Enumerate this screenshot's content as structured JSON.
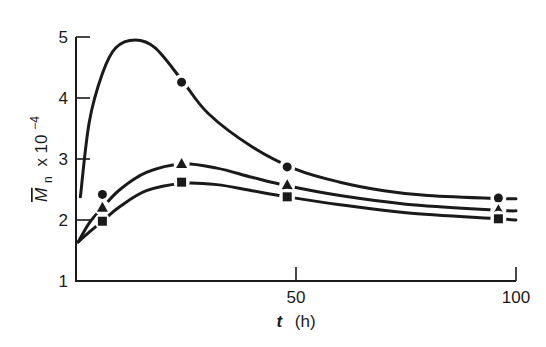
{
  "chart_data": {
    "type": "line",
    "title": "",
    "xlabel": "t (h)",
    "ylabel": "M̄n x 10⁻⁴",
    "ylabel_parts": {
      "symbol": "M",
      "subscript": "n",
      "times": "x 10",
      "exponent": "−4"
    },
    "xlabel_parts": {
      "symbol": "t",
      "unit": "(h)"
    },
    "xlim": [
      0,
      100
    ],
    "ylim": [
      1,
      5
    ],
    "xticks": [
      0,
      50,
      100
    ],
    "xtick_labels": [
      "",
      "50",
      "100"
    ],
    "yticks": [
      1,
      2,
      3,
      4,
      5
    ],
    "ytick_labels": [
      "1",
      "2",
      "3",
      "4",
      "5"
    ],
    "grid": false,
    "legend": null,
    "series": [
      {
        "name": "circles",
        "marker": "circle",
        "points": [
          [
            6,
            2.42
          ],
          [
            24,
            4.26
          ],
          [
            48,
            2.87
          ],
          [
            96,
            2.36
          ]
        ],
        "curve": [
          [
            1,
            2.38
          ],
          [
            3,
            3.6
          ],
          [
            6,
            4.4
          ],
          [
            9,
            4.82
          ],
          [
            13.5,
            4.95
          ],
          [
            18,
            4.82
          ],
          [
            24,
            4.3
          ],
          [
            30,
            3.75
          ],
          [
            40,
            3.2
          ],
          [
            50,
            2.83
          ],
          [
            60,
            2.62
          ],
          [
            70,
            2.48
          ],
          [
            80,
            2.4
          ],
          [
            96,
            2.35
          ],
          [
            100,
            2.35
          ]
        ]
      },
      {
        "name": "triangles",
        "marker": "triangle",
        "points": [
          [
            6,
            2.2
          ],
          [
            24,
            2.92
          ],
          [
            48,
            2.57
          ],
          [
            96,
            2.16
          ]
        ],
        "curve": [
          [
            0.5,
            1.64
          ],
          [
            3,
            1.95
          ],
          [
            6,
            2.2
          ],
          [
            10,
            2.5
          ],
          [
            16,
            2.78
          ],
          [
            24,
            2.92
          ],
          [
            32,
            2.85
          ],
          [
            40,
            2.7
          ],
          [
            48,
            2.56
          ],
          [
            60,
            2.4
          ],
          [
            75,
            2.26
          ],
          [
            96,
            2.16
          ],
          [
            100,
            2.15
          ]
        ]
      },
      {
        "name": "squares",
        "marker": "square",
        "points": [
          [
            6,
            1.98
          ],
          [
            24,
            2.62
          ],
          [
            48,
            2.38
          ],
          [
            96,
            2.02
          ]
        ],
        "curve": [
          [
            0.5,
            1.64
          ],
          [
            3,
            1.8
          ],
          [
            6,
            1.98
          ],
          [
            10,
            2.22
          ],
          [
            16,
            2.48
          ],
          [
            24,
            2.6
          ],
          [
            32,
            2.58
          ],
          [
            40,
            2.48
          ],
          [
            48,
            2.38
          ],
          [
            60,
            2.25
          ],
          [
            75,
            2.12
          ],
          [
            96,
            2.02
          ],
          [
            100,
            2.0
          ]
        ]
      }
    ]
  },
  "layout": {
    "plot_left": 76,
    "plot_right": 516,
    "plot_top": 37,
    "plot_bottom": 281,
    "line_color": "#1a1a1a"
  }
}
